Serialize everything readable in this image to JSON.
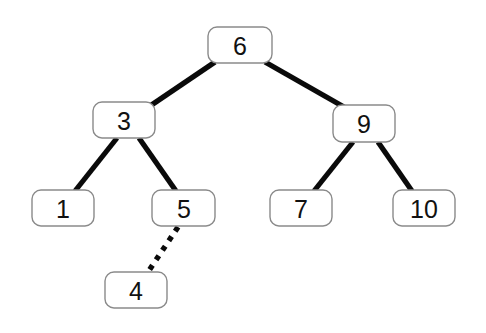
{
  "diagram": {
    "type": "binary-search-tree",
    "background_color": "#ffffff",
    "node_fill": "#ffffff",
    "node_border_color": "#8a8a8a",
    "edge_color": "#0a0a0a",
    "nodes": [
      {
        "id": "n6",
        "label": "6",
        "x": 240,
        "y": 45,
        "w": 64,
        "h": 36,
        "level": 0
      },
      {
        "id": "n3",
        "label": "3",
        "x": 124,
        "y": 120,
        "w": 62,
        "h": 36,
        "level": 1
      },
      {
        "id": "n9",
        "label": "9",
        "x": 364,
        "y": 124,
        "w": 62,
        "h": 37,
        "level": 1
      },
      {
        "id": "n1",
        "label": "1",
        "x": 63,
        "y": 208,
        "w": 62,
        "h": 36,
        "level": 2
      },
      {
        "id": "n5",
        "label": "5",
        "x": 184,
        "y": 208,
        "w": 63,
        "h": 36,
        "level": 2
      },
      {
        "id": "n7",
        "label": "7",
        "x": 301,
        "y": 208,
        "w": 62,
        "h": 36,
        "level": 2
      },
      {
        "id": "n10",
        "label": "10",
        "x": 424,
        "y": 208,
        "w": 62,
        "h": 36,
        "level": 2
      },
      {
        "id": "n4",
        "label": "4",
        "x": 136,
        "y": 290,
        "w": 62,
        "h": 36,
        "level": 3
      }
    ],
    "edges": [
      {
        "id": "e6-3",
        "from": "n6",
        "to": "n3",
        "style": "solid",
        "x1": 215,
        "y1": 62,
        "x2": 150,
        "y2": 106
      },
      {
        "id": "e6-9",
        "from": "n6",
        "to": "n9",
        "style": "solid",
        "x1": 265,
        "y1": 62,
        "x2": 344,
        "y2": 107
      },
      {
        "id": "e3-1",
        "from": "n3",
        "to": "n1",
        "style": "solid",
        "x1": 117,
        "y1": 138,
        "x2": 75,
        "y2": 191
      },
      {
        "id": "e3-5",
        "from": "n3",
        "to": "n5",
        "style": "solid",
        "x1": 139,
        "y1": 138,
        "x2": 176,
        "y2": 191
      },
      {
        "id": "e9-7",
        "from": "n9",
        "to": "n7",
        "style": "solid",
        "x1": 353,
        "y1": 142,
        "x2": 314,
        "y2": 191
      },
      {
        "id": "e9-10",
        "from": "n9",
        "to": "n10",
        "style": "solid",
        "x1": 378,
        "y1": 142,
        "x2": 412,
        "y2": 191
      },
      {
        "id": "e5-4",
        "from": "n5",
        "to": "n4",
        "style": "dotted",
        "x1": 178,
        "y1": 227,
        "x2": 148,
        "y2": 272
      }
    ]
  }
}
